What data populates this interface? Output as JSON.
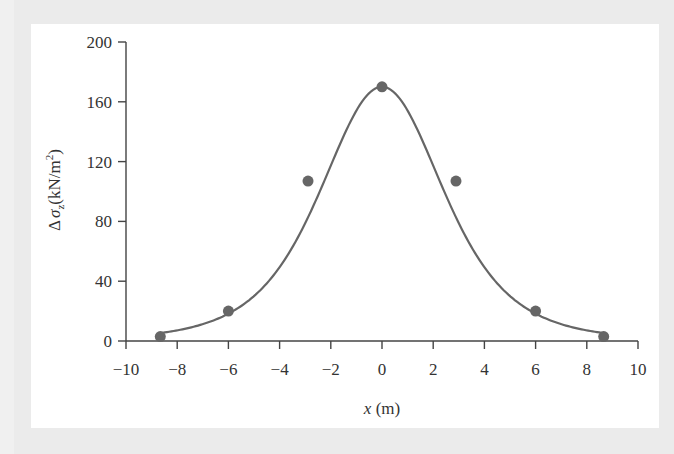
{
  "chart_data": {
    "type": "line",
    "title": "",
    "xlabel": "x (m)",
    "xlabel_var": "x",
    "xlabel_unit": "(m)",
    "ylabel": "Δσz (kN/m²)",
    "ylabel_prefix": "Δ",
    "ylabel_var": "σ",
    "ylabel_sub": "z",
    "ylabel_unit": "(kN/m",
    "ylabel_sup": "2",
    "ylabel_close": ")",
    "xlim": [
      -10,
      10
    ],
    "ylim": [
      0,
      200
    ],
    "xticks": [
      -10,
      -8,
      -6,
      -4,
      -2,
      0,
      2,
      4,
      6,
      8,
      10
    ],
    "xtick_labels": [
      "−10",
      "−8",
      "−6",
      "−4",
      "−2",
      "0",
      "2",
      "4",
      "6",
      "8",
      "10"
    ],
    "yticks": [
      0,
      40,
      80,
      120,
      160,
      200
    ],
    "ytick_labels": [
      "0",
      "40",
      "80",
      "120",
      "160",
      "200"
    ],
    "grid": false,
    "legend": null,
    "series": [
      {
        "name": "Δσz",
        "x": [
          -8.66,
          -6,
          -2.89,
          0,
          2.89,
          6,
          8.66
        ],
        "y": [
          3,
          20,
          107,
          170,
          107,
          20,
          3
        ],
        "markers": true,
        "smooth_curve": true,
        "color": "#666666"
      }
    ]
  }
}
